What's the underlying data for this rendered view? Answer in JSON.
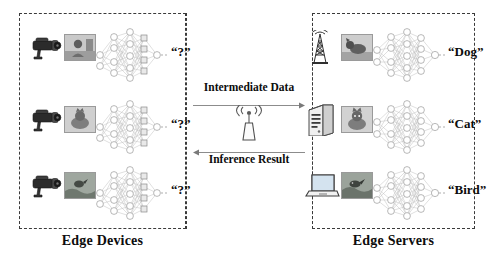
{
  "diagram": {
    "left_panel": {
      "caption": "Edge Devices",
      "rows": [
        {
          "device_icon": "security-camera-icon",
          "input_image": "person-photo-thumbnail",
          "network": "partial-dnn",
          "output_label": "“?”"
        },
        {
          "device_icon": "security-camera-icon",
          "input_image": "cat-photo-thumbnail",
          "network": "partial-dnn",
          "output_label": "“?”"
        },
        {
          "device_icon": "security-camera-icon",
          "input_image": "bird-photo-thumbnail",
          "network": "partial-dnn",
          "output_label": "“?”"
        }
      ]
    },
    "center_panel": {
      "uplink_label": "Intermediate Data",
      "downlink_label": "Inference Result",
      "radio_icon": "wireless-access-point-icon"
    },
    "right_panel": {
      "caption": "Edge Servers",
      "rows": [
        {
          "device_icon": "cell-tower-icon",
          "input_image": "dog-photo-thumbnail",
          "network": "full-dnn",
          "output_label": "“Dog”"
        },
        {
          "device_icon": "server-tower-icon",
          "input_image": "cat-photo-thumbnail",
          "network": "full-dnn",
          "output_label": "“Cat”"
        },
        {
          "device_icon": "laptop-icon",
          "input_image": "bird-photo-thumbnail",
          "network": "full-dnn",
          "output_label": "“Bird”"
        }
      ]
    },
    "colors": {
      "border": "#3a3a3a",
      "node_stroke": "#8f8f8f",
      "edge_stroke": "#b4b4b4",
      "text": "#0d0d0d"
    }
  }
}
